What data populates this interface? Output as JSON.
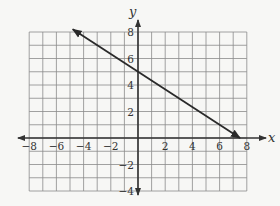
{
  "chart_data": {
    "type": "line",
    "title": "",
    "xlabel": "x",
    "ylabel": "y",
    "xlim": [
      -8,
      8
    ],
    "ylim": [
      -4,
      8
    ],
    "grid": true,
    "grid_step": 1,
    "x_ticks": [
      -8,
      -6,
      -4,
      -2,
      2,
      4,
      6,
      8
    ],
    "x_tick_labels": [
      "−8",
      "−6",
      "−4",
      "−2",
      "2",
      "4",
      "6",
      "8"
    ],
    "y_ticks": [
      8,
      6,
      4,
      2,
      -2,
      -4
    ],
    "y_tick_labels": [
      "8",
      "6",
      "4",
      "2",
      "−2",
      "−4"
    ],
    "series": [
      {
        "name": "line",
        "equation": "y = -2/3 x + 5",
        "slope": -0.6667,
        "y_intercept": 5,
        "x_intercept": 7.5,
        "x": [
          -4.8,
          0,
          7.5
        ],
        "y": [
          8.2,
          5,
          0
        ],
        "arrow_start": true,
        "arrow_end": true
      }
    ],
    "colors": {
      "grid": "#8a8a8a",
      "axes": "#333333",
      "line": "#2a2a2a",
      "background": "#f7f7f5"
    }
  }
}
